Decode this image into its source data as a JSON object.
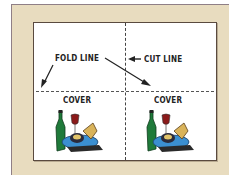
{
  "diagram": {
    "labels": {
      "fold_line": "FOLD LINE",
      "cut_line": "CUT LINE",
      "cover_left": "COVER",
      "cover_right": "COVER"
    },
    "colors": {
      "mat": "#e8dcbf",
      "mat_border": "#8f7f86",
      "sheet": "#ffffff",
      "sheet_border": "#5a4a3f",
      "line": "#333333"
    },
    "icons": {
      "cover_art": "wine-bottle-glass-and-food-platter-icon"
    }
  }
}
